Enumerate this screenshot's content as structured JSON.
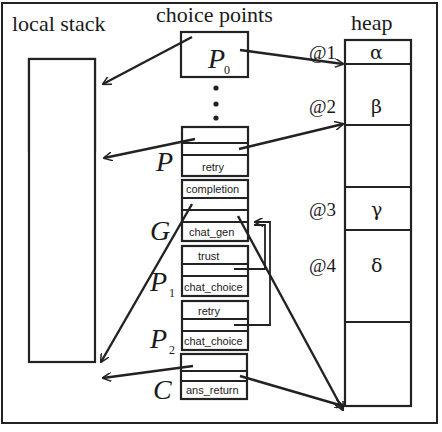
{
  "titles": {
    "local_stack": "local stack",
    "choice_points": "choice points",
    "heap": "heap"
  },
  "choice_points": {
    "p0": {
      "name": "P",
      "sub": "0"
    },
    "ellipsis": "⋮",
    "p": {
      "name": "P",
      "cells": [
        "",
        "",
        "retry"
      ]
    },
    "g": {
      "name": "G",
      "cells": [
        "completion",
        "",
        "chat_gen"
      ]
    },
    "p1": {
      "name": "P",
      "sub": "1",
      "cells": [
        "trust",
        "",
        "chat_choice"
      ]
    },
    "p2": {
      "name": "P",
      "sub": "2",
      "cells": [
        "retry",
        "",
        "chat_choice"
      ]
    },
    "c": {
      "name": "C",
      "cells": [
        "",
        "",
        "ans_return"
      ]
    }
  },
  "heap": {
    "cells": [
      {
        "addr": "@1",
        "value": "α"
      },
      {
        "addr": "@2",
        "value": "β"
      },
      {
        "addr": "",
        "value": ""
      },
      {
        "addr": "@3",
        "value": "γ"
      },
      {
        "addr": "@4",
        "value": "δ"
      },
      {
        "addr": "",
        "value": ""
      }
    ]
  }
}
